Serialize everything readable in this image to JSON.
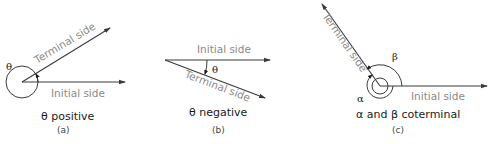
{
  "figures": [
    {
      "id": "a",
      "initial_side_label": "Initial side",
      "terminal_side_label": "Terminal side",
      "angle_label": "θ",
      "caption": "θ positive",
      "sublabel": "(a)"
    },
    {
      "id": "b",
      "initial_side_label": "Initial side",
      "terminal_side_label": "Terminal side",
      "angle_label": "θ",
      "caption": "θ negative",
      "sublabel": "(b)"
    },
    {
      "id": "c",
      "initial_side_label": "Initial side",
      "terminal_side_label": "Terminal side",
      "angle_label_1": "β",
      "angle_label_2": "α",
      "caption": "α and β coterminal",
      "sublabel": "(c)"
    }
  ],
  "colors": {
    "ray": "#3a3a3a",
    "side_label": "#8a8a8a",
    "caption": "#1a1a1a"
  }
}
